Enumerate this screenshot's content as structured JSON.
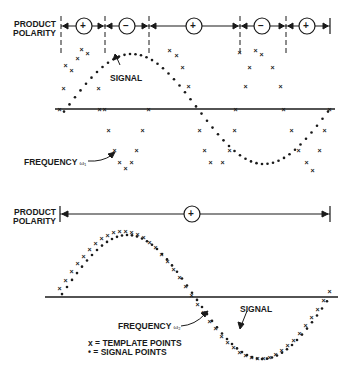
{
  "top_panel": {
    "polarity_label_line1": "PRODUCT",
    "polarity_label_line2": "POLARITY",
    "polarity_signs": [
      "+",
      "−",
      "+",
      "−",
      "+"
    ],
    "signal_label": "SIGNAL",
    "frequency_label": "FREQUENCY",
    "frequency_symbol": "ω₁"
  },
  "bottom_panel": {
    "polarity_label_line1": "PRODUCT",
    "polarity_label_line2": "POLARITY",
    "polarity_signs": [
      "+"
    ],
    "signal_label": "SIGNAL",
    "frequency_label": "FREQUENCY",
    "frequency_symbol": "ω₂"
  },
  "legend": {
    "template": "x = TEMPLATE POINTS",
    "signal": "• = SIGNAL POINTS"
  },
  "colors": {
    "ink": "#1a1a1a",
    "background": "#ffffff"
  }
}
